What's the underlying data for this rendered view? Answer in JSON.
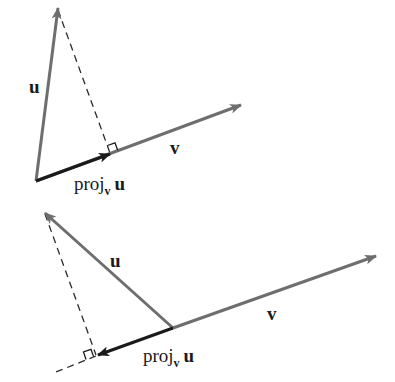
{
  "colors": {
    "vector_u": "#6e6e6e",
    "vector_v": "#6e6e6e",
    "projection": "#1a1a1a",
    "dashed": "#2a2a2a",
    "label": "#1a1a1a",
    "background": "#ffffff"
  },
  "diagrams": [
    {
      "name": "acute-angle-projection",
      "labels": {
        "u": "u",
        "v": "v",
        "proj_prefix": "proj",
        "proj_sub": "v",
        "proj_vec": "u"
      },
      "points": {
        "origin": [
          36,
          181
        ],
        "u_tip": [
          58,
          8
        ],
        "v_tip": [
          241,
          105
        ],
        "proj_tip": [
          110,
          154
        ]
      }
    },
    {
      "name": "obtuse-angle-projection",
      "labels": {
        "u": "u",
        "v": "v",
        "proj_prefix": "proj",
        "proj_sub": "v",
        "proj_vec": "u"
      },
      "points": {
        "origin": [
          173,
          328
        ],
        "u_tip": [
          45,
          213
        ],
        "v_tip": [
          376,
          256
        ],
        "proj_tip": [
          98,
          355
        ],
        "dash_ext_end": [
          56,
          372
        ]
      }
    }
  ]
}
